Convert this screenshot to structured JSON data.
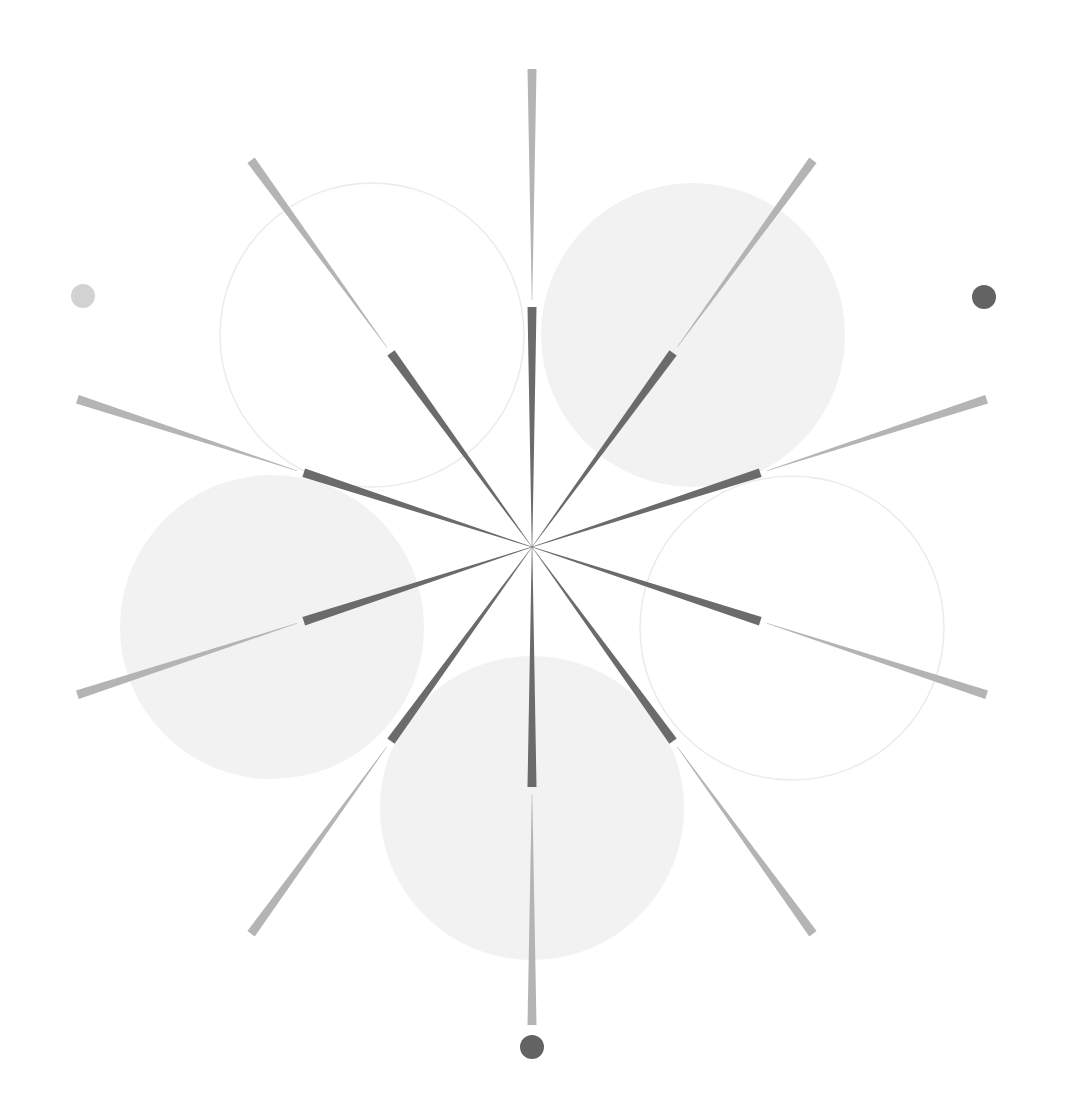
{
  "canvas": {
    "width": 1073,
    "height": 1105,
    "background": "#ffffff"
  },
  "center": {
    "x": 532,
    "y": 547
  },
  "colors": {
    "inner_ray": "#6b6b6b",
    "outer_ray": "#b4b4b4",
    "circle_fill": "#f2f2f2",
    "circle_stroke": "#ebebeb",
    "dot_light": "#d2d2d2",
    "dot_dark": "#636363"
  },
  "rays": {
    "count": 10,
    "angle_step_deg": 36,
    "inner": {
      "r_start": 0,
      "r_end": 240,
      "width_start": 0.5,
      "width_end": 9
    },
    "outer": {
      "r_start": 247,
      "r_end": 478,
      "width_start": 0.5,
      "width_end": 9
    }
  },
  "circles": [
    {
      "name": "circle-top-left",
      "cx": 372,
      "cy": 335,
      "r": 152,
      "style": "outline"
    },
    {
      "name": "circle-top-right",
      "cx": 693,
      "cy": 335,
      "r": 152,
      "style": "filled"
    },
    {
      "name": "circle-left",
      "cx": 272,
      "cy": 627,
      "r": 152,
      "style": "filled"
    },
    {
      "name": "circle-right",
      "cx": 792,
      "cy": 628,
      "r": 152,
      "style": "outline"
    },
    {
      "name": "circle-bottom",
      "cx": 532,
      "cy": 808,
      "r": 152,
      "style": "filled"
    }
  ],
  "dots": [
    {
      "name": "dot-left",
      "cx": 83,
      "cy": 296,
      "r": 12,
      "tone": "light"
    },
    {
      "name": "dot-right",
      "cx": 984,
      "cy": 297,
      "r": 12,
      "tone": "dark"
    },
    {
      "name": "dot-bottom",
      "cx": 532,
      "cy": 1047,
      "r": 12,
      "tone": "dark"
    }
  ]
}
